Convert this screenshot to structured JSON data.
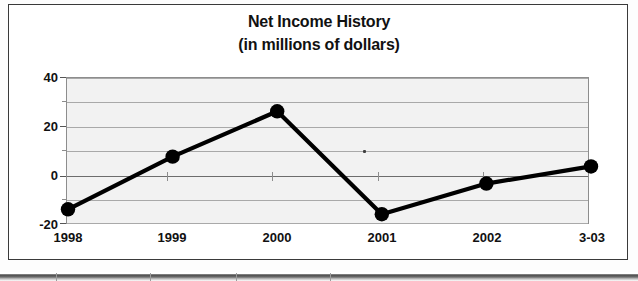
{
  "chart_data": {
    "type": "line",
    "title": "Net Income History",
    "subtitle": "(in millions of dollars)",
    "xlabel": "",
    "ylabel": "",
    "categories": [
      "1998",
      "1999",
      "2000",
      "2001",
      "2002",
      "3-03"
    ],
    "values": [
      -14,
      7.5,
      26,
      -16,
      -3.5,
      3.5
    ],
    "series": [
      {
        "name": "Net Income",
        "values": [
          -14,
          7.5,
          26,
          -16,
          -3.5,
          3.5
        ]
      }
    ],
    "ylim": [
      -20,
      40
    ],
    "yticks": [
      40,
      20,
      0,
      -20
    ],
    "ytick_labels": [
      "40",
      "20",
      "0",
      "-20"
    ],
    "yticks_minor": [
      30,
      10,
      -10
    ],
    "grid": true,
    "legend": null,
    "marker": "filled-circle",
    "line_color": "#000000",
    "marker_color": "#000000",
    "plot_background": "#f2f2f2",
    "zero_line": 0
  },
  "figure": {
    "title": "Net Income History",
    "subtitle": "(in millions of dollars)"
  },
  "axis": {
    "y_labels": [
      "40",
      "20",
      "0",
      "-20"
    ],
    "x_labels": [
      "1998",
      "1999",
      "2000",
      "2001",
      "2002",
      "3-03"
    ]
  },
  "artifacts": {
    "speck_label": "scan-speck"
  }
}
